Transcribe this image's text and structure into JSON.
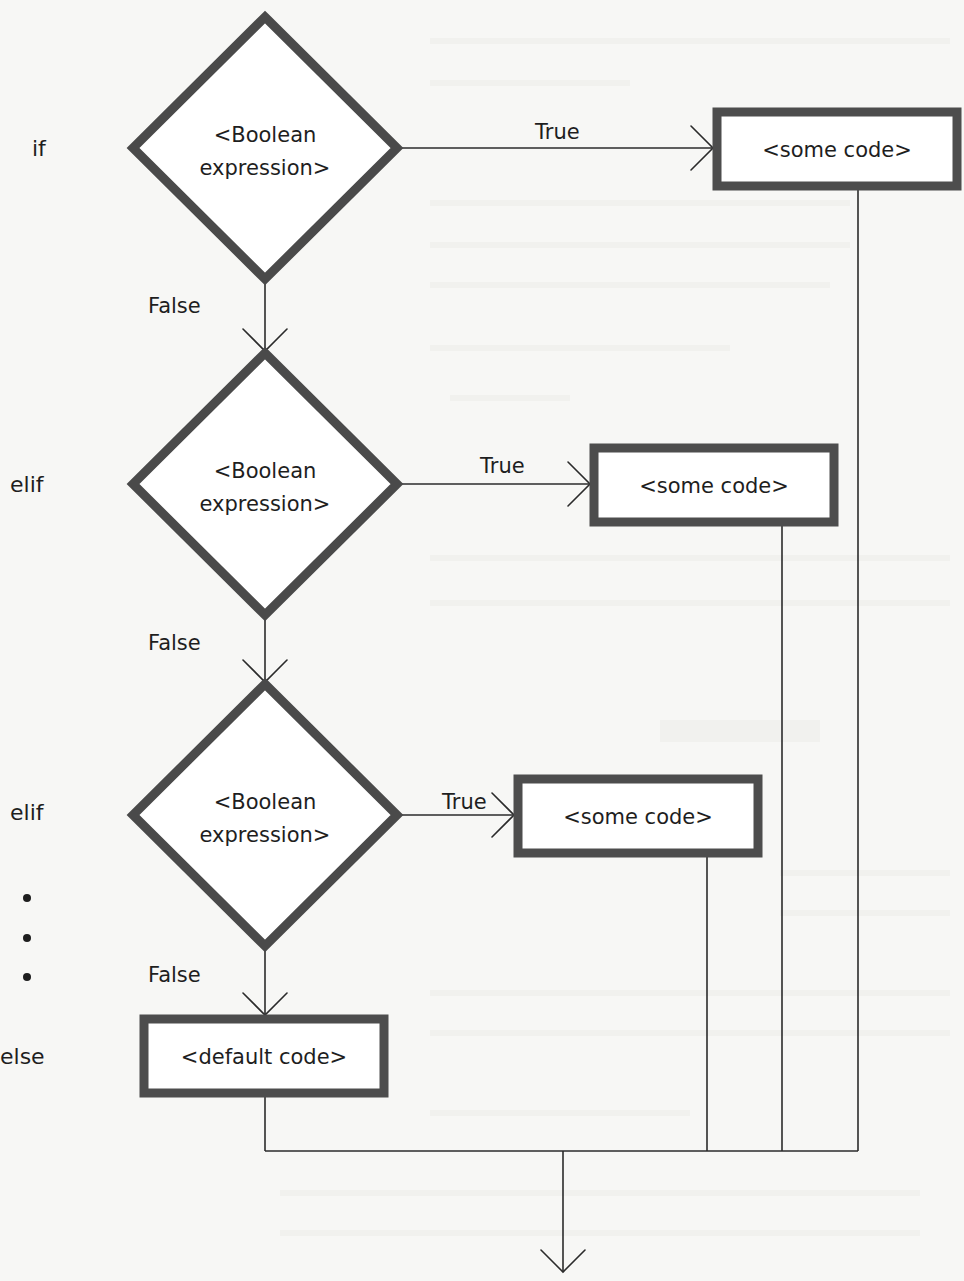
{
  "diagram": {
    "title": "",
    "type": "flowchart",
    "side_labels": [
      {
        "id": "lbl-if",
        "text": "if",
        "x": 32,
        "y": 156
      },
      {
        "id": "lbl-elif-1",
        "text": "elif",
        "x": 10,
        "y": 492
      },
      {
        "id": "lbl-elif-2",
        "text": "elif",
        "x": 10,
        "y": 820
      },
      {
        "id": "lbl-else",
        "text": "else",
        "x": 0,
        "y": 1064
      }
    ],
    "ellipsis_dots": [
      {
        "x": 27,
        "y": 898
      },
      {
        "x": 27,
        "y": 938
      },
      {
        "x": 27,
        "y": 977
      }
    ],
    "decisions": [
      {
        "id": "cond-1",
        "line1": "<Boolean",
        "line2": "expression>",
        "cx": 265,
        "cy": 148,
        "half_w": 132,
        "half_h": 131
      },
      {
        "id": "cond-2",
        "line1": "<Boolean",
        "line2": "expression>",
        "cx": 265,
        "cy": 484,
        "half_w": 132,
        "half_h": 131
      },
      {
        "id": "cond-3",
        "line1": "<Boolean",
        "line2": "expression>",
        "cx": 265,
        "cy": 815,
        "half_w": 132,
        "half_h": 131
      }
    ],
    "processes": [
      {
        "id": "code-1",
        "text": "<some code>",
        "x": 717,
        "y": 112,
        "w": 240,
        "h": 74
      },
      {
        "id": "code-2",
        "text": "<some code>",
        "x": 594,
        "y": 448,
        "w": 240,
        "h": 74
      },
      {
        "id": "code-3",
        "text": "<some code>",
        "x": 518,
        "y": 779,
        "w": 240,
        "h": 74
      },
      {
        "id": "default",
        "text": "<default code>",
        "x": 144,
        "y": 1019,
        "w": 240,
        "h": 74
      }
    ],
    "edges": [
      {
        "id": "e-true-1",
        "label": "True",
        "label_x": 535,
        "label_y": 139
      },
      {
        "id": "e-true-2",
        "label": "True",
        "label_x": 480,
        "label_y": 473
      },
      {
        "id": "e-true-3",
        "label": "True",
        "label_x": 442,
        "label_y": 809
      },
      {
        "id": "e-false-1",
        "label": "False",
        "label_x": 148,
        "label_y": 313
      },
      {
        "id": "e-false-2",
        "label": "False",
        "label_x": 148,
        "label_y": 650
      },
      {
        "id": "e-false-3",
        "label": "False",
        "label_x": 148,
        "label_y": 982
      }
    ],
    "merge": {
      "y": 1151,
      "x_start": 265,
      "x_end": 858,
      "drop_x": 563,
      "exit_y": 1272,
      "verticals_x": [
        858,
        782,
        707
      ]
    }
  },
  "colors": {
    "shape_stroke": "#4a4a4a",
    "line": "#2b2b2b",
    "text": "#1e1e1e",
    "background": "#f7f7f5"
  }
}
